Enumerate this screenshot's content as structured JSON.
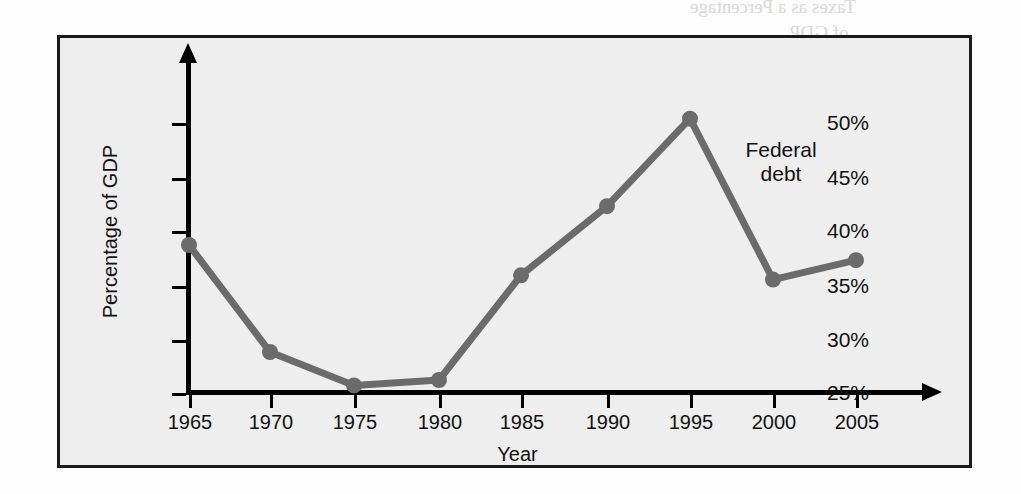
{
  "chart_data": {
    "type": "line",
    "title": "",
    "xlabel": "Year",
    "ylabel": "Percentage of GDP",
    "categories": [
      "1965",
      "1970",
      "1975",
      "1980",
      "1985",
      "1990",
      "1995",
      "2000",
      "2005"
    ],
    "x": [
      1965,
      1970,
      1975,
      1980,
      1985,
      1990,
      1995,
      2000,
      2005
    ],
    "series": [
      {
        "name": "Federal debt",
        "values": [
          38.7,
          28.8,
          25.7,
          26.2,
          35.9,
          42.3,
          50.4,
          35.5,
          37.3
        ]
      }
    ],
    "xtick_labels": [
      "1965",
      "1970",
      "1975",
      "1980",
      "1985",
      "1990",
      "1995",
      "2000",
      "2005"
    ],
    "ytick_labels": [
      "25%",
      "30%",
      "35%",
      "40%",
      "45%",
      "50%"
    ],
    "ytick_values": [
      25,
      30,
      35,
      40,
      45,
      50
    ],
    "ylim": [
      25,
      52.5
    ],
    "xlim": [
      1965,
      2007
    ],
    "grid": false,
    "legend": "none",
    "annotations": [
      {
        "text_line1": "Federal",
        "text_line2": "debt",
        "target_series": "Federal debt"
      }
    ],
    "colors": {
      "series_line": "#6b6b6b",
      "marker": "#6b6b6b",
      "axis": "#000000",
      "panel_background": "#eeeeee",
      "page_background": "#fdfdfd",
      "text": "#111111"
    }
  },
  "annotation": {
    "line1": "Federal",
    "line2": "debt"
  },
  "bleed_text": {
    "b1": "Taxes as a Percentage",
    "b2": "of GDP",
    "b3": "ng gap was greatest",
    "b4": "n the 1980s.",
    "b5": "urce: U.S. Government",
    "b6": "Budget Office",
    "b7": "Federal",
    "b8": "spending",
    "b9": "Federal",
    "b10": "taxes",
    "b11": "Percentage of GDP",
    "b12": "Year"
  }
}
